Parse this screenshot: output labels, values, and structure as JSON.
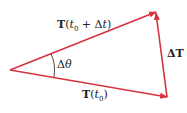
{
  "diagram": {
    "type": "vector-triangle",
    "colors": {
      "vector": "#d8323f",
      "text": "#222222",
      "arc": "#333333"
    },
    "vectors": [
      {
        "name": "T(t0+Δt)",
        "from": [
          10,
          70
        ],
        "to": [
          156,
          12
        ]
      },
      {
        "name": "T(t0)",
        "from": [
          10,
          70
        ],
        "to": [
          167,
          97
        ]
      },
      {
        "name": "ΔT",
        "from": [
          167,
          97
        ],
        "to": [
          156,
          12
        ]
      }
    ],
    "labels": {
      "top_vector": {
        "T": "T",
        "open": "(",
        "t": "t",
        "sub": "0",
        "mid": " + Δ",
        "t2": "t",
        "close": ")"
      },
      "bottom_vector": {
        "T": "T",
        "open": "(",
        "t": "t",
        "sub": "0",
        "close": ")"
      },
      "delta_T": "ΔT",
      "angle": {
        "delta": "Δ",
        "theta": "θ"
      }
    }
  }
}
